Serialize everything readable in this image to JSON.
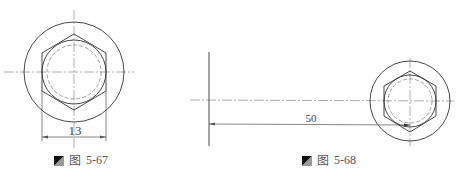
{
  "figures": [
    {
      "id": "fig-5-67",
      "caption_prefix": "图",
      "caption_number": "5-67",
      "dimension_label": "13"
    },
    {
      "id": "fig-5-68",
      "caption_prefix": "图",
      "caption_number": "5-68",
      "dimension_label": "50"
    }
  ],
  "colors": {
    "line": "#333333",
    "centerline": "#888888",
    "dashed": "#888888",
    "caption_text": "#555555",
    "icon_dark": "#111111",
    "icon_light": "#9a9a9a"
  }
}
